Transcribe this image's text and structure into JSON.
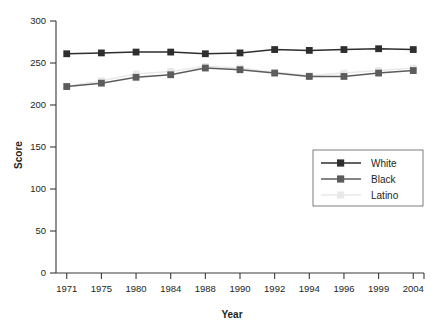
{
  "chart_data": {
    "type": "line",
    "title": "",
    "xlabel": "Year",
    "ylabel": "Score",
    "categories": [
      "1971",
      "1975",
      "1980",
      "1984",
      "1988",
      "1990",
      "1992",
      "1994",
      "1996",
      "1999",
      "2004"
    ],
    "ylim": [
      0,
      300
    ],
    "yticks": [
      0,
      50,
      100,
      150,
      200,
      250,
      300
    ],
    "ytick_labels": [
      "0",
      "50",
      "100",
      "150",
      "200",
      "250",
      "300"
    ],
    "grid": false,
    "legend_position": "center-right",
    "series": [
      {
        "name": "White",
        "color": "#2e2e2e",
        "marker": "square",
        "values": [
          261,
          262,
          263,
          263,
          261,
          262,
          266,
          265,
          266,
          267,
          266
        ]
      },
      {
        "name": "Black",
        "color": "#5c5c5c",
        "marker": "square",
        "values": [
          222,
          226,
          233,
          236,
          244,
          242,
          238,
          234,
          234,
          238,
          241
        ]
      },
      {
        "name": "Latino",
        "color": "#e9e9e9",
        "marker": "square",
        "values": [
          222,
          229,
          237,
          240,
          246,
          244,
          239,
          235,
          238,
          241,
          244
        ]
      }
    ]
  },
  "legend": {
    "entries": [
      {
        "label": "White"
      },
      {
        "label": "Black"
      },
      {
        "label": "Latino"
      }
    ]
  },
  "axes": {
    "y_title": "Score",
    "x_title": "Year"
  }
}
